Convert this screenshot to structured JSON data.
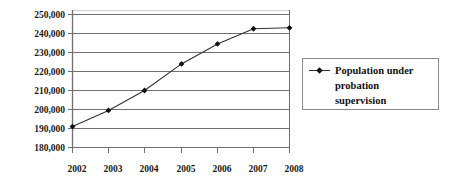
{
  "chart_data": {
    "type": "line",
    "title": "",
    "xlabel": "",
    "ylabel": "",
    "categories": [
      "2002",
      "2003",
      "2004",
      "2005",
      "2006",
      "2007",
      "2008"
    ],
    "series": [
      {
        "name": "Population under probation supervision",
        "values": [
          191000,
          199500,
          210000,
          224000,
          234500,
          242500,
          243000
        ]
      }
    ],
    "ylim": [
      180000,
      250000
    ],
    "ytick_values": [
      180000,
      190000,
      200000,
      210000,
      220000,
      230000,
      240000,
      250000
    ],
    "ytick_labels": [
      "180,000",
      "190,000",
      "200,000",
      "210,000",
      "220,000",
      "230,000",
      "240,000",
      "250,000"
    ],
    "xtick_labels": [
      "2002",
      "2003",
      "2004",
      "2005",
      "2006",
      "2007",
      "2008"
    ],
    "grid": true,
    "legend_position": "right",
    "marker": "diamond",
    "colors": {
      "line": "#333333",
      "marker": "#111111",
      "gridline": "#6f6f6f",
      "axis": "#6f6f6f",
      "text": "#1a1a1a",
      "legend_border": "#8a8a8a",
      "background": "#ffffff"
    }
  },
  "legend": {
    "entries": [
      {
        "label_line1": "Population under",
        "label_line2": "probation",
        "label_line3": "supervision",
        "marker": "line-diamond-marker"
      }
    ]
  }
}
